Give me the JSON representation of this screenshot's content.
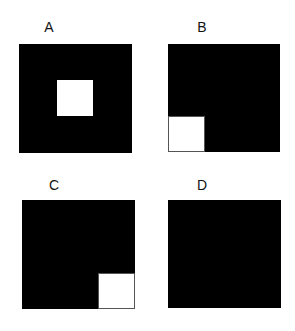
{
  "panels": [
    {
      "label": "A",
      "fill": "#000000",
      "white_square": "center"
    },
    {
      "label": "B",
      "fill": "#000000",
      "white_square": "bottom-left"
    },
    {
      "label": "C",
      "fill": "#000000",
      "white_square": "bottom-right"
    },
    {
      "label": "D",
      "fill": "#000000",
      "white_square": "none"
    }
  ]
}
